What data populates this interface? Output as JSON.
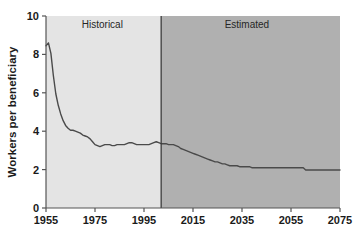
{
  "chart_data": {
    "type": "line",
    "title": "",
    "subtitle": "",
    "xlabel": "",
    "ylabel": "Workers per beneficiary",
    "xlim": [
      1955,
      2075
    ],
    "ylim": [
      0,
      10
    ],
    "grid": false,
    "legend_position": "none",
    "x_ticks": [
      "1955",
      "1975",
      "1995",
      "2015",
      "2035",
      "2055",
      "2075"
    ],
    "x_tick_values": [
      1955,
      1975,
      1995,
      2015,
      2035,
      2055,
      2075
    ],
    "y_ticks": [
      "0",
      "2",
      "4",
      "6",
      "8",
      "10"
    ],
    "y_tick_values": [
      0,
      2,
      4,
      6,
      8,
      10
    ],
    "annotations": [
      {
        "text": "Historical",
        "x": 1978,
        "y": 9.4,
        "region": "historical"
      },
      {
        "text": "Estimated",
        "x": 2037,
        "y": 9.4,
        "region": "estimated"
      }
    ],
    "regions": [
      {
        "name": "Historical",
        "x_start": 1955,
        "x_end": 2002,
        "fill": "#e4e4e4"
      },
      {
        "name": "Estimated",
        "x_start": 2002,
        "x_end": 2075,
        "fill": "#b0b0b0"
      }
    ],
    "divider_x": 2002,
    "series": [
      {
        "name": "Workers per beneficiary",
        "color": "#4a4a4a",
        "x": [
          1955,
          1956,
          1957,
          1958,
          1959,
          1960,
          1961,
          1962,
          1963,
          1964,
          1965,
          1966,
          1967,
          1968,
          1969,
          1970,
          1971,
          1972,
          1973,
          1974,
          1975,
          1976,
          1977,
          1978,
          1979,
          1980,
          1981,
          1982,
          1983,
          1984,
          1985,
          1986,
          1987,
          1988,
          1989,
          1990,
          1991,
          1992,
          1993,
          1994,
          1995,
          1996,
          1997,
          1998,
          1999,
          2000,
          2001,
          2002,
          2003,
          2004,
          2005,
          2006,
          2007,
          2008,
          2009,
          2010,
          2011,
          2012,
          2013,
          2014,
          2015,
          2016,
          2017,
          2018,
          2019,
          2020,
          2021,
          2022,
          2023,
          2024,
          2025,
          2026,
          2027,
          2028,
          2029,
          2030,
          2031,
          2032,
          2033,
          2034,
          2035,
          2036,
          2037,
          2038,
          2039,
          2040,
          2041,
          2042,
          2043,
          2044,
          2045,
          2046,
          2047,
          2048,
          2049,
          2050,
          2051,
          2052,
          2053,
          2054,
          2055,
          2056,
          2057,
          2058,
          2059,
          2060,
          2061,
          2062,
          2063,
          2064,
          2065,
          2066,
          2067,
          2068,
          2069,
          2070,
          2071,
          2072,
          2073,
          2074,
          2075
        ],
        "y": [
          8.45,
          8.6,
          8.05,
          6.9,
          5.95,
          5.35,
          4.9,
          4.55,
          4.3,
          4.15,
          4.05,
          4.05,
          4.0,
          3.95,
          3.9,
          3.8,
          3.75,
          3.7,
          3.6,
          3.45,
          3.3,
          3.25,
          3.2,
          3.25,
          3.3,
          3.3,
          3.3,
          3.25,
          3.25,
          3.3,
          3.3,
          3.3,
          3.3,
          3.35,
          3.4,
          3.4,
          3.35,
          3.3,
          3.3,
          3.3,
          3.3,
          3.3,
          3.3,
          3.35,
          3.4,
          3.45,
          3.4,
          3.35,
          3.35,
          3.35,
          3.3,
          3.3,
          3.3,
          3.25,
          3.2,
          3.1,
          3.05,
          3.0,
          2.95,
          2.9,
          2.85,
          2.8,
          2.75,
          2.7,
          2.65,
          2.6,
          2.55,
          2.5,
          2.45,
          2.4,
          2.4,
          2.35,
          2.3,
          2.3,
          2.25,
          2.2,
          2.2,
          2.2,
          2.2,
          2.15,
          2.15,
          2.15,
          2.15,
          2.15,
          2.1,
          2.1,
          2.1,
          2.1,
          2.1,
          2.1,
          2.1,
          2.1,
          2.1,
          2.1,
          2.1,
          2.1,
          2.1,
          2.1,
          2.1,
          2.1,
          2.1,
          2.1,
          2.1,
          2.1,
          2.1,
          2.1,
          1.98,
          1.98,
          1.98,
          1.98,
          1.98,
          1.98,
          1.98,
          1.98,
          1.98,
          1.98,
          1.98,
          1.98,
          1.98,
          1.98,
          1.98
        ]
      }
    ]
  },
  "colors": {
    "historical_fill": "#e4e4e4",
    "estimated_fill": "#b0b0b0",
    "line": "#4a4a4a",
    "axis": "#555555",
    "text": "#1a1a1a",
    "background": "#ffffff"
  }
}
